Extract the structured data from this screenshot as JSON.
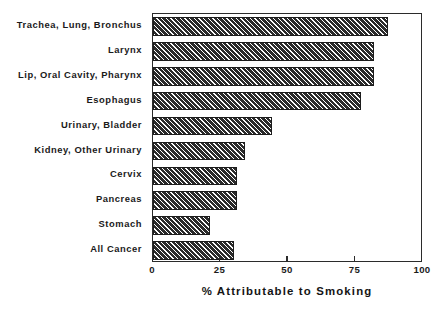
{
  "chart_data": {
    "type": "bar",
    "orientation": "horizontal",
    "title": "",
    "xlabel": "% Attributable to Smoking",
    "ylabel": "",
    "xlim": [
      0,
      100
    ],
    "xticks": [
      0,
      25,
      50,
      75,
      100
    ],
    "xtick_labels": [
      "0",
      "25",
      "50",
      "75",
      "100"
    ],
    "grid": false,
    "legend": null,
    "categories": [
      "Trachea, Lung, Bronchus",
      "Larynx",
      "Lip, Oral Cavity, Pharynx",
      "Esophagus",
      "Urinary, Bladder",
      "Kidney, Other Urinary",
      "Cervix",
      "Pancreas",
      "Stomach",
      "All Cancer"
    ],
    "values": [
      87,
      82,
      82,
      77,
      44,
      34,
      31,
      31,
      21,
      30
    ],
    "bar_style": {
      "fill": "#2e2e2e",
      "hatch": "diagonal-45",
      "edge": "#1c1c1c"
    }
  },
  "axis": {
    "title": "% Attributable to Smoking",
    "tick_labels": [
      "0",
      "25",
      "50",
      "75",
      "100"
    ]
  }
}
